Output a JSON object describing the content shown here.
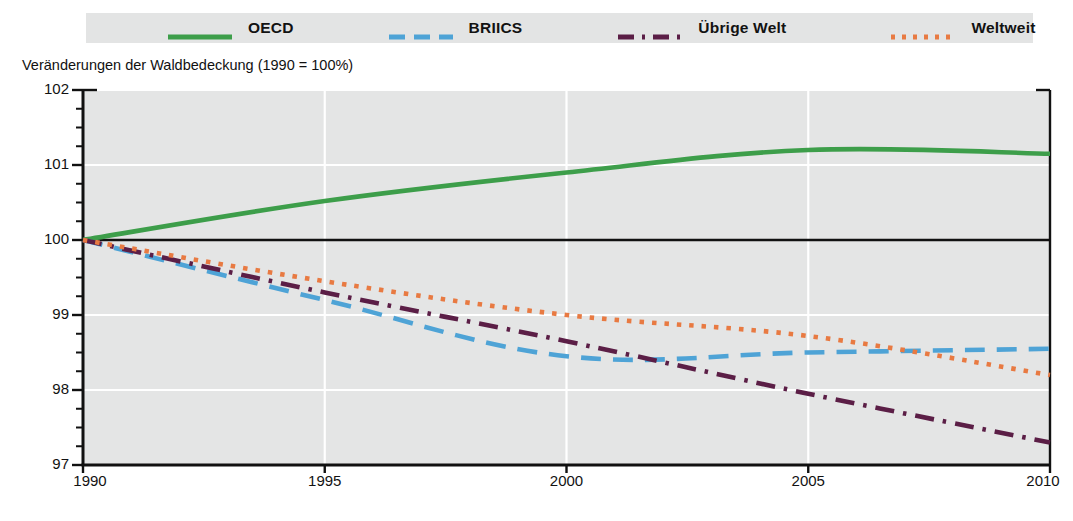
{
  "axis_title": "Veränderungen der Waldbedeckung (1990 = 100%)",
  "colors": {
    "oecd": "#3d9e4a",
    "briics": "#4ea3d6",
    "uebrige_welt": "#5b1e46",
    "weltweit": "#e87a42",
    "plot_background": "#e4e5e5",
    "legend_background": "#e3e4e4",
    "gridline": "#ffffff",
    "axis": "#111111",
    "baseline": "#111111"
  },
  "legend": {
    "items": [
      {
        "label": "OECD",
        "style": "solid",
        "swatch_name": "legend-swatch-oecd"
      },
      {
        "label": "BRIICS",
        "style": "dashed",
        "swatch_name": "legend-swatch-briics"
      },
      {
        "label": "Übrige Welt",
        "style": "dash-dot",
        "swatch_name": "legend-swatch-uebrige-welt"
      },
      {
        "label": "Weltweit",
        "style": "dotted",
        "swatch_name": "legend-swatch-weltweit"
      }
    ]
  },
  "chart_data": {
    "type": "line",
    "title": "Veränderungen der Waldbedeckung (1990 = 100%)",
    "xlabel": "",
    "ylabel": "Veränderungen der Waldbedeckung (1990 = 100%)",
    "xlim": [
      1990,
      2010
    ],
    "ylim": [
      97,
      102
    ],
    "grid": true,
    "legend_position": "top",
    "x_ticks": [
      1990,
      1995,
      2000,
      2005,
      2010
    ],
    "x_tick_labels": [
      "1990",
      "1995",
      "2000",
      "2005",
      "2010"
    ],
    "y_ticks": [
      97,
      98,
      99,
      100,
      101,
      102
    ],
    "y_tick_labels": [
      "97",
      "98",
      "99",
      "100",
      "101",
      "102"
    ],
    "y_minor_tick_step": 0.25,
    "reference_line": 100,
    "x": [
      1990,
      1995,
      2000,
      2005,
      2010
    ],
    "series": [
      {
        "name": "OECD",
        "style": "solid",
        "color": "#3d9e4a",
        "values": [
          100.0,
          100.52,
          100.9,
          101.2,
          101.15
        ]
      },
      {
        "name": "BRIICS",
        "style": "dashed",
        "color": "#4ea3d6",
        "values": [
          100.0,
          99.2,
          98.45,
          98.5,
          98.55
        ]
      },
      {
        "name": "Übrige Welt",
        "style": "dash-dot",
        "color": "#5b1e46",
        "values": [
          100.0,
          99.3,
          98.65,
          97.95,
          97.3
        ]
      },
      {
        "name": "Weltweit",
        "style": "dotted",
        "color": "#e87a42",
        "values": [
          100.0,
          99.45,
          99.0,
          98.72,
          98.2
        ]
      }
    ]
  }
}
